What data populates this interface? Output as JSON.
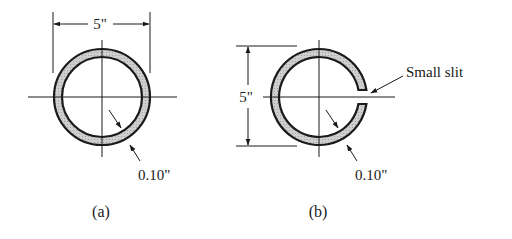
{
  "colors": {
    "ink": "#1a1a1a",
    "wall_fill": "#c8c8c8",
    "background": "#ffffff"
  },
  "figure_a": {
    "caption": "(a)",
    "diameter_label": "5\"",
    "thickness_label": "0.10\"",
    "description": "Closed thin-walled circular tube"
  },
  "figure_b": {
    "caption": "(b)",
    "diameter_label": "5\"",
    "thickness_label": "0.10\"",
    "slit_label": "Small slit",
    "description": "Open thin-walled circular tube with small slit"
  }
}
